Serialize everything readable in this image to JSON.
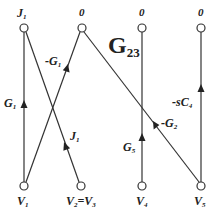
{
  "title": {
    "main": "G",
    "sub": "23"
  },
  "top_nodes": [
    {
      "id": "J1",
      "label": "J",
      "sub": "1",
      "x": 24,
      "y": 28
    },
    {
      "id": "0a",
      "label": "0",
      "sub": "",
      "x": 82,
      "y": 28
    },
    {
      "id": "0b",
      "label": "0",
      "sub": "",
      "x": 142,
      "y": 28
    },
    {
      "id": "0c",
      "label": "0",
      "sub": "",
      "x": 201,
      "y": 28
    }
  ],
  "bottom_nodes": [
    {
      "id": "V1",
      "label": "V",
      "sub": "1",
      "x": 24,
      "y": 186
    },
    {
      "id": "V2V3",
      "label": "V",
      "sub": "2",
      "label2": "=V",
      "sub2": "3",
      "x": 81,
      "y": 186
    },
    {
      "id": "V4",
      "label": "V",
      "sub": "4",
      "x": 142,
      "y": 186
    },
    {
      "id": "V5",
      "label": "V",
      "sub": "5",
      "x": 201,
      "y": 186
    }
  ],
  "edges": [
    {
      "from": "V1",
      "to": "J1",
      "label": "G",
      "sub": "1"
    },
    {
      "from": "V1",
      "to": "0a",
      "label": "-G",
      "sub": "1"
    },
    {
      "from": "V2V3",
      "to": "J1",
      "label": "J",
      "sub": "1"
    },
    {
      "from": "V4",
      "to": "0b",
      "label": "G",
      "sub": "5"
    },
    {
      "from": "V5",
      "to": "0a",
      "label": "-G",
      "sub": "2"
    },
    {
      "from": "V5",
      "to": "0c",
      "label": "-sC",
      "sub": "4"
    }
  ],
  "edge_labels": {
    "g1": {
      "t": "G",
      "s": "1"
    },
    "neg_g1": {
      "t": "-G",
      "s": "1"
    },
    "j1": {
      "t": "J",
      "s": "1"
    },
    "g5": {
      "t": "G",
      "s": "5"
    },
    "neg_g2": {
      "t": "-G",
      "s": "2"
    },
    "neg_sc4": {
      "t": "-sC",
      "s": "4"
    }
  },
  "node_labels": {
    "j1": {
      "t": "J",
      "s": "1"
    },
    "zero1": "0",
    "zero2": "0",
    "zero3": "0",
    "v1": {
      "t": "V",
      "s": "1"
    },
    "v2": {
      "t": "V",
      "s": "2"
    },
    "eq_v3": {
      "t": "=V",
      "s": "3"
    },
    "v4": {
      "t": "V",
      "s": "4"
    },
    "v5": {
      "t": "V",
      "s": "5"
    }
  }
}
